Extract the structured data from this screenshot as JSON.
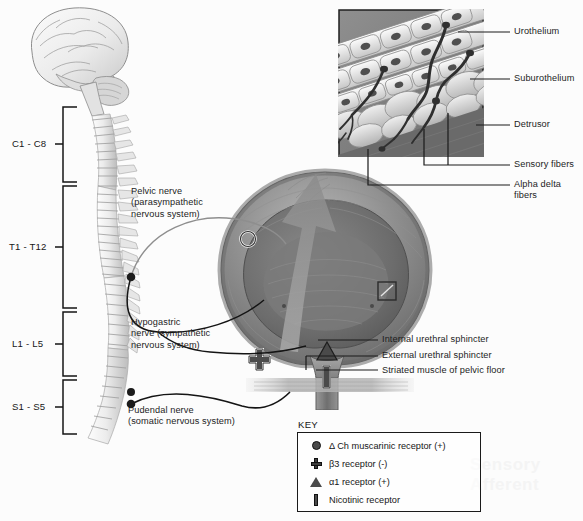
{
  "figure": {
    "background_color": "#fcfcfc",
    "ink_color": "#1a1a1a"
  },
  "spinal_segments": [
    {
      "label": "C1 - C8",
      "region": "cervical"
    },
    {
      "label": "T1 - T12",
      "region": "thoracic"
    },
    {
      "label": "L1 - L5",
      "region": "lumbar"
    },
    {
      "label": "S1 - S5",
      "region": "sacral"
    }
  ],
  "nerve_labels": [
    {
      "name": "pelvic-nerve",
      "text": "Pelvic nerve\n(parasympathetic\nnervous system)"
    },
    {
      "name": "hypogastric-nerve",
      "text": "Hypogastric\nnerve (sympathetic\nnervous system)"
    },
    {
      "name": "pudendal-nerve",
      "text": "Pudendal nerve\n(somatic nervous system)"
    }
  ],
  "inset_callouts": [
    {
      "name": "urothelium",
      "text": "Urothelium"
    },
    {
      "name": "suburothelium",
      "text": "Suburothelium"
    },
    {
      "name": "detrusor",
      "text": "Detrusor"
    },
    {
      "name": "sensory-fibers",
      "text": "Sensory fibers"
    },
    {
      "name": "alpha-delta-fibers",
      "text": "Alpha delta\nfibers"
    }
  ],
  "sphincter_callouts": [
    {
      "name": "internal-urethral-sphincter",
      "text": "Internal urethral sphincter"
    },
    {
      "name": "external-urethral-sphincter",
      "text": "External urethral sphincter"
    },
    {
      "name": "striated-muscle-pelvic-floor",
      "text": "Striated muscle of pelvic floor"
    }
  ],
  "key": {
    "title": "KEY",
    "items": [
      {
        "symbol": "circle",
        "text": "Δ Ch muscarinic receptor (+)"
      },
      {
        "symbol": "plus",
        "text": "β3 receptor (-)"
      },
      {
        "symbol": "triangle",
        "text": "α1 receptor (+)"
      },
      {
        "symbol": "bar",
        "text": "Nicotinic receptor"
      }
    ]
  },
  "markers_on_anatomy": [
    {
      "name": "muscarinic-marker-circle",
      "symbol": "circle-outline",
      "location": "bladder-dome-left"
    },
    {
      "name": "beta3-marker-plus",
      "symbol": "plus",
      "location": "bladder-wall-left"
    },
    {
      "name": "alpha1-marker-triangle",
      "symbol": "triangle",
      "location": "bladder-neck"
    },
    {
      "name": "nicotinic-marker-bar",
      "symbol": "bar",
      "location": "urethra"
    },
    {
      "name": "inset-source-square",
      "symbol": "square-outline",
      "location": "bladder-wall-right"
    }
  ],
  "bleed_through_text": "Sensory Afferent"
}
